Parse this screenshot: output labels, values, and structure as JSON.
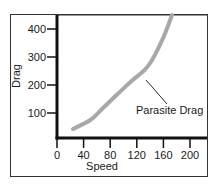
{
  "chart_data": {
    "type": "line",
    "title": "",
    "xlabel": "Speed",
    "ylabel": "Drag",
    "xlim": [
      0,
      220
    ],
    "ylim": [
      10,
      450
    ],
    "x_ticks": [
      0,
      40,
      80,
      120,
      160,
      200
    ],
    "y_ticks": [
      100,
      200,
      300,
      400
    ],
    "grid": false,
    "legend": "none",
    "series": [
      {
        "name": "Parasite Drag",
        "x": [
          24,
          50,
          68,
          90,
          110,
          132,
          143,
          160,
          173
        ],
        "y": [
          43,
          75,
          115,
          165,
          210,
          254,
          289,
          370,
          450
        ]
      }
    ],
    "annotations": [
      {
        "text": "Parasite Drag",
        "points_to": [
          132,
          250
        ]
      }
    ]
  },
  "axes": {
    "x_label": "Speed",
    "y_label": "Drag",
    "x_tick_labels": [
      "0",
      "40",
      "80",
      "120",
      "160",
      "200"
    ],
    "y_tick_labels": [
      "100",
      "200",
      "300",
      "400"
    ]
  },
  "annotation": {
    "label": "Parasite Drag"
  },
  "colors": {
    "curve": "#a8a8a8",
    "axis": "#111111",
    "frame": "#333333",
    "text": "#1a1a1a"
  }
}
